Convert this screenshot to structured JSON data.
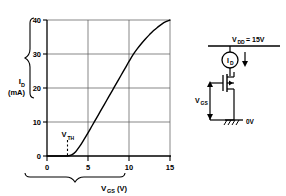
{
  "chart_data": {
    "type": "line",
    "title": "",
    "xlabel": "V",
    "xlabel_sub": "GS",
    "xlabel_units": "(V)",
    "ylabel": "I",
    "ylabel_sub": "D",
    "ylabel_units": "(mA)",
    "xlim": [
      0,
      15
    ],
    "ylim": [
      0,
      40
    ],
    "xticks": [
      "0",
      "5",
      "10",
      "15"
    ],
    "xtick_values": [
      0,
      5,
      10,
      15
    ],
    "yticks": [
      "0",
      "10",
      "20",
      "30",
      "40"
    ],
    "ytick_values": [
      0,
      10,
      20,
      30,
      40
    ],
    "grid": true,
    "legend": "none",
    "x": [
      0,
      1,
      2,
      2.5,
      3,
      3.5,
      4,
      4.5,
      5,
      5.5,
      6,
      6.5,
      7,
      7.5,
      8,
      8.5,
      9,
      9.5,
      10,
      10.5,
      11,
      11.5,
      12,
      12.5,
      13,
      13.5,
      14,
      14.5,
      15
    ],
    "values": [
      0,
      0,
      0,
      0,
      0.32,
      1.28,
      2.88,
      4.8,
      6.8,
      8.9,
      11.0,
      13.1,
      15.2,
      17.3,
      19.4,
      21.5,
      23.6,
      25.7,
      27.8,
      29.8,
      31.5,
      33.0,
      34.4,
      35.7,
      36.9,
      37.9,
      38.8,
      39.5,
      40.0
    ],
    "annotations": [
      {
        "name": "threshold-voltage",
        "label": "V",
        "label_sub": "TH",
        "x": 2.5,
        "style": "dashed-vertical-marker"
      }
    ]
  },
  "circuit": {
    "supply_label": "V",
    "supply_sub": "DD",
    "supply_value": "= 15V",
    "current_label": "I",
    "current_sub": "D",
    "gate_source_label": "V",
    "gate_source_sub": "GS",
    "ground_label": "0V",
    "components": [
      {
        "name": "supply-rail",
        "type": "rail"
      },
      {
        "name": "current-source",
        "type": "circle-source"
      },
      {
        "name": "current-direction-arrow",
        "type": "arrow-down"
      },
      {
        "name": "mosfet",
        "type": "n-channel-mosfet"
      },
      {
        "name": "ground-symbol",
        "type": "earth-ground"
      }
    ]
  },
  "colors": {
    "ink": "#000000",
    "grid": "#4a4a4a",
    "background": "#ffffff"
  }
}
